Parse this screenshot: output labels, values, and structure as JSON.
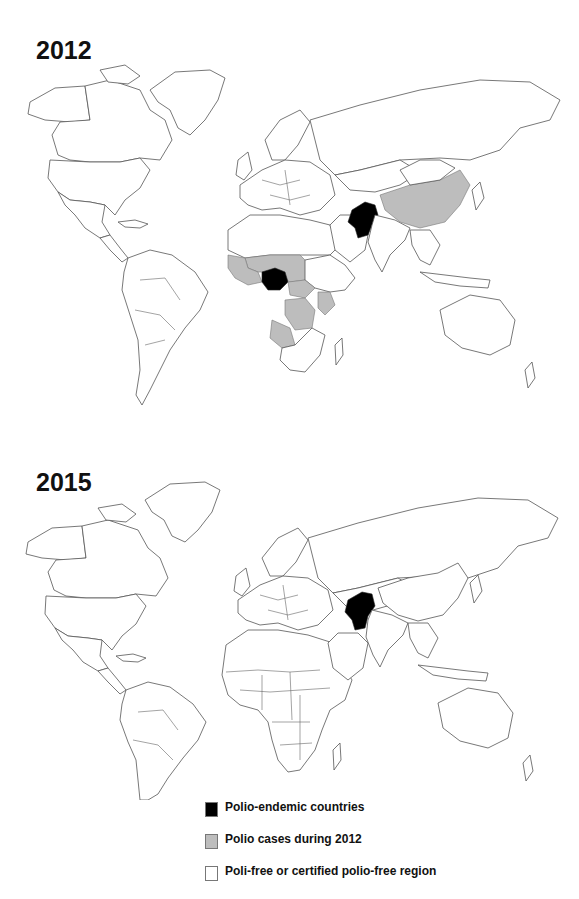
{
  "maps": [
    {
      "year": "2012",
      "endemic_countries": [
        "Nigeria",
        "Pakistan",
        "Afghanistan"
      ],
      "polio_case_countries": [
        "Mali",
        "Niger",
        "Chad",
        "Cameroon",
        "Central African Republic",
        "DR Congo",
        "Angola",
        "Kenya",
        "Côte d'Ivoire",
        "Guinea",
        "Sierra Leone",
        "Liberia",
        "Burkina Faso",
        "China"
      ]
    },
    {
      "year": "2015",
      "endemic_countries": [
        "Pakistan",
        "Afghanistan"
      ],
      "polio_case_countries": []
    }
  ],
  "legend": {
    "items": [
      {
        "label": "Polio-endemic countries",
        "color": "#000000"
      },
      {
        "label": "Polio cases during 2012",
        "color": "#bdbdbd"
      },
      {
        "label": "Poli-free or certified polio-free region",
        "color": "#ffffff"
      }
    ]
  }
}
